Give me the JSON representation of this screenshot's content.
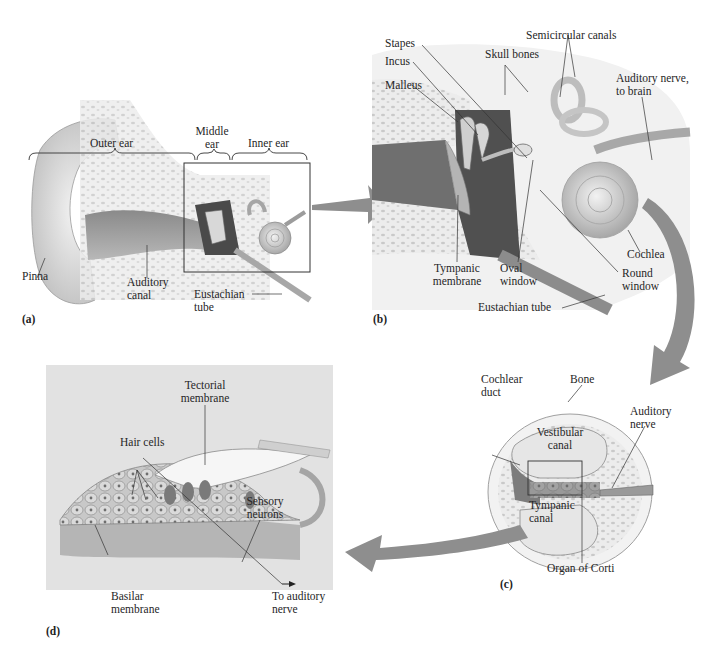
{
  "figure": {
    "arrow_color": "#8e8e8e",
    "panel_d_background": "#e2e2e2"
  },
  "panels": {
    "a": {
      "id": "(a)",
      "labels": {
        "outer_ear": "Outer ear",
        "middle_ear_1": "Middle",
        "middle_ear_2": "ear",
        "inner_ear": "Inner ear",
        "pinna": "Pinna",
        "auditory_canal_1": "Auditory",
        "auditory_canal_2": "canal",
        "eustachian_tube_1": "Eustachian",
        "eustachian_tube_2": "tube"
      }
    },
    "b": {
      "id": "(b)",
      "labels": {
        "stapes": "Stapes",
        "incus": "Incus",
        "malleus": "Malleus",
        "skull_bones": "Skull bones",
        "semicircular_canals": "Semicircular canals",
        "auditory_nerve_1": "Auditory nerve,",
        "auditory_nerve_2": "to brain",
        "cochlea": "Cochlea",
        "tympanic_membrane_1": "Tympanic",
        "tympanic_membrane_2": "membrane",
        "oval_window_1": "Oval",
        "oval_window_2": "window",
        "round_window_1": "Round",
        "round_window_2": "window",
        "eustachian_tube": "Eustachian tube"
      }
    },
    "c": {
      "id": "(c)",
      "labels": {
        "cochlear_duct_1": "Cochlear",
        "cochlear_duct_2": "duct",
        "bone": "Bone",
        "auditory_nerve_1": "Auditory",
        "auditory_nerve_2": "nerve",
        "vestibular_canal_1": "Vestibular",
        "vestibular_canal_2": "canal",
        "tympanic_canal_1": "Tympanic",
        "tympanic_canal_2": "canal",
        "organ_of_corti": "Organ of Corti"
      }
    },
    "d": {
      "id": "(d)",
      "labels": {
        "tectorial_membrane_1": "Tectorial",
        "tectorial_membrane_2": "membrane",
        "hair_cells": "Hair cells",
        "sensory_neurons_1": "Sensory",
        "sensory_neurons_2": "neurons",
        "basilar_membrane_1": "Basilar",
        "basilar_membrane_2": "membrane",
        "to_auditory_nerve_1": "To auditory",
        "to_auditory_nerve_2": "nerve"
      }
    }
  }
}
